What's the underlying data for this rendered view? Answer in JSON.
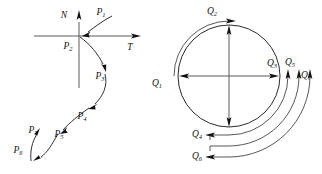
{
  "figure": {
    "background_color": "#ffffff",
    "stroke_color": "#1a1a1a",
    "width": 322,
    "height": 174
  },
  "left_diagram": {
    "name": "s-curve-with-tangent-normal-axes",
    "axes": {
      "vertical_label": "N",
      "horizontal_label": "T",
      "origin_x": 79,
      "origin_y": 36
    },
    "points": [
      {
        "id": "P1",
        "base": "P",
        "sub": "1",
        "x": 101,
        "y": 13
      },
      {
        "id": "P2",
        "base": "P",
        "sub": "2",
        "x": 68,
        "y": 47
      },
      {
        "id": "P3",
        "base": "P",
        "sub": "3",
        "x": 100,
        "y": 77
      },
      {
        "id": "P4",
        "base": "P",
        "sub": "4",
        "x": 82,
        "y": 117
      },
      {
        "id": "P5",
        "base": "P",
        "sub": "5",
        "x": 59,
        "y": 135
      },
      {
        "id": "P6",
        "base": "P",
        "sub": "6",
        "x": 18,
        "y": 151
      },
      {
        "id": "P7",
        "base": "P",
        "sub": "7",
        "x": 33,
        "y": 131
      }
    ]
  },
  "right_diagram": {
    "name": "circle-with-concentric-flow-arcs",
    "circle": {
      "center_x": 229,
      "center_y": 76,
      "radius": 51
    },
    "arcs": [
      {
        "id": "arc-Q2",
        "radius": 55
      },
      {
        "id": "arc-Q3",
        "radius": 59
      },
      {
        "id": "arc-Q5",
        "radius": 70
      },
      {
        "id": "arc-Q7",
        "radius": 81
      }
    ],
    "labels": [
      {
        "id": "Q1",
        "base": "Q",
        "sub": "1",
        "x": 157,
        "y": 84
      },
      {
        "id": "Q2",
        "base": "Q",
        "sub": "2",
        "x": 212,
        "y": 12
      },
      {
        "id": "Q3",
        "base": "Q",
        "sub": "3",
        "x": 272,
        "y": 64
      },
      {
        "id": "Q4",
        "base": "Q",
        "sub": "4",
        "x": 197,
        "y": 135
      },
      {
        "id": "Q5",
        "base": "Q",
        "sub": "5",
        "x": 290,
        "y": 63
      },
      {
        "id": "Q6",
        "base": "Q",
        "sub": "6",
        "x": 197,
        "y": 157
      },
      {
        "id": "Q7",
        "base": "Q",
        "sub": "7",
        "x": 306,
        "y": 76
      }
    ]
  }
}
